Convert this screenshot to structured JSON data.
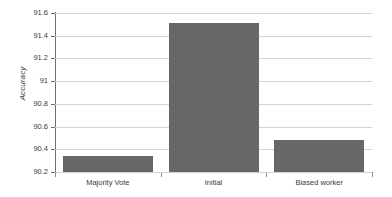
{
  "chart_data": {
    "type": "bar",
    "title": "",
    "xlabel": "",
    "ylabel": "Accuracy",
    "categories": [
      "Majority Vote",
      "Initial",
      "Biased worker"
    ],
    "values": [
      90.34,
      91.51,
      90.48
    ],
    "ylim": [
      90.2,
      91.6
    ],
    "yticks": [
      90.2,
      90.4,
      90.6,
      90.8,
      91,
      91.2,
      91.4,
      91.6
    ],
    "ytick_labels": [
      "90.2",
      "90.4",
      "90.6",
      "90.8",
      "91",
      "91.2",
      "91.4",
      "91.6"
    ],
    "grid": true,
    "legend": null,
    "series": [
      {
        "name": "Accuracy",
        "values": [
          90.34,
          91.51,
          90.48
        ],
        "color": "#676767"
      }
    ],
    "colors": {
      "bar": "#676767",
      "gridline": "#d4d4d4",
      "axis": "#6f6f6f",
      "text": "#3a3a3a",
      "background": "#ffffff"
    }
  }
}
